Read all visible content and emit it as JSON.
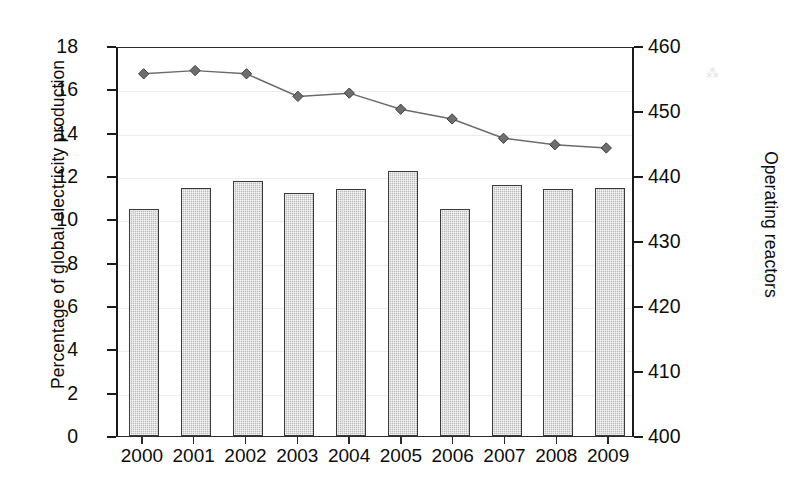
{
  "chart_data": {
    "type": "bar",
    "title": "",
    "subtitle": "",
    "xlabel": "",
    "ylabel": "Percentage of global electricity production",
    "y2label": "Operating reactors",
    "categories": [
      "2000",
      "2001",
      "2002",
      "2003",
      "2004",
      "2005",
      "2006",
      "2007",
      "2008",
      "2009"
    ],
    "ylim": [
      0,
      18
    ],
    "yticks": [
      0,
      2,
      4,
      6,
      8,
      10,
      12,
      14,
      16,
      18
    ],
    "ytick_labels": [
      "0",
      "2",
      "4",
      "6",
      "8",
      "10",
      "12",
      "14",
      "16",
      "18"
    ],
    "y2lim": [
      400,
      460
    ],
    "y2ticks": [
      400,
      410,
      420,
      430,
      440,
      450,
      460
    ],
    "y2tick_labels": [
      "400",
      "410",
      "420",
      "430",
      "440",
      "450",
      "460"
    ],
    "grid": true,
    "legend": "none",
    "series": [
      {
        "name": "Percentage of global electricity production",
        "type": "bar",
        "axis": "left",
        "values": [
          10.5,
          11.45,
          11.75,
          11.2,
          11.4,
          12.25,
          10.5,
          11.6,
          11.4,
          11.45
        ],
        "color": "#bcbcbc",
        "edge_color": "#3a3a3a"
      },
      {
        "name": "Operating reactors",
        "type": "line",
        "axis": "right",
        "marker": "diamond",
        "values": [
          456.0,
          456.5,
          456.0,
          452.5,
          453.0,
          450.5,
          449.0,
          446.0,
          445.0,
          444.5
        ],
        "color": "#6b6b6b",
        "marker_color": "#6e6e6e"
      }
    ]
  },
  "artifact": {
    "glyph": "⁂"
  }
}
